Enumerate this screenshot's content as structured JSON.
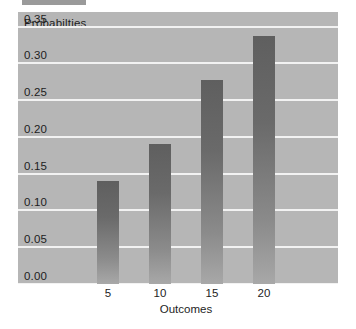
{
  "top_fragment": {
    "name": "toolbar-fragment",
    "color": "#9a9a9a"
  },
  "chart_data": {
    "type": "bar",
    "title": "",
    "subtitle": "",
    "xlabel": "Outcomes",
    "ylabel": "Probabilties",
    "categories": [
      "5",
      "10",
      "15",
      "20"
    ],
    "values": [
      0.14,
      0.19,
      0.277,
      0.338
    ],
    "series": [
      {
        "name": "Probabilties",
        "values": [
          0.14,
          0.19,
          0.277,
          0.338
        ]
      }
    ],
    "ylim": [
      0.0,
      0.37
    ],
    "yticks": [
      "0.00",
      "0.05",
      "0.10",
      "0.15",
      "0.20",
      "0.25",
      "0.30",
      "0.35"
    ],
    "ytick_values": [
      0.0,
      0.05,
      0.1,
      0.15,
      0.2,
      0.25,
      0.3,
      0.35
    ],
    "xticks": [
      "5",
      "10",
      "15",
      "20"
    ],
    "grid": true,
    "grid_axis": "y",
    "grid_color": "#f2f2f2",
    "legend": false,
    "legend_position": "none",
    "plot_background": "#b6b6b6",
    "figure_background": "#ffffff",
    "bar_color_top": "#5f5f5f",
    "bar_color_bottom": "#a8a8a8",
    "tick_label_color": "#1d1d1d"
  }
}
